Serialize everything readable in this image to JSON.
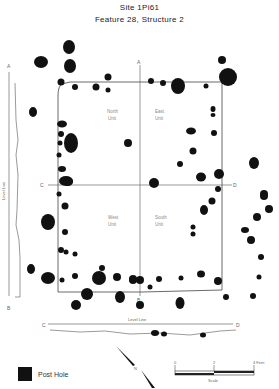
{
  "title": {
    "line1": "Site 1Pi61",
    "line2": "Feature 28, Structure 2"
  },
  "units": {
    "north": [
      "North",
      "Unit"
    ],
    "east": [
      "East",
      "Unit"
    ],
    "west": [
      "West",
      "Unit"
    ],
    "south": [
      "South",
      "Unit"
    ]
  },
  "profile_labels": {
    "a": "A",
    "b": "B",
    "c": "C",
    "d": "D",
    "level_line_vertical": "Level Line",
    "level_line_horizontal": "Level Line"
  },
  "legend": {
    "symbol": "post-hole-square",
    "label": "Post Hole"
  },
  "scale": {
    "ticks": [
      "0",
      "2",
      "4 Feet"
    ],
    "label": "Scale"
  },
  "north_arrow": {
    "label": "N"
  },
  "colors": {
    "ink": "#111111",
    "line": "#444444",
    "text": "#222222"
  }
}
